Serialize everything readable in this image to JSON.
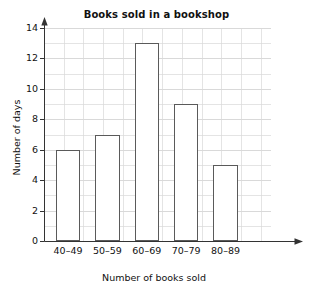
{
  "chart_data": {
    "type": "bar",
    "title": "Books sold in a bookshop",
    "xlabel": "Number of books sold",
    "ylabel": "Number of days",
    "categories": [
      "40–49",
      "50–59",
      "60–69",
      "70–79",
      "80–89"
    ],
    "values": [
      6,
      7,
      13,
      9,
      5
    ],
    "series": [
      {
        "name": "Number of days",
        "values": [
          6,
          7,
          13,
          9,
          5
        ]
      }
    ],
    "ylim": [
      0,
      14
    ],
    "y_tick_step": 2,
    "y_tick_labels": [
      "0",
      "2",
      "4",
      "6",
      "8",
      "10",
      "12",
      "14"
    ],
    "y_minor_step": 1,
    "xlim_categories": 5,
    "grid": true,
    "grid_color": "#d9d9d9",
    "legend": "none",
    "bar_fill": "#ffffff",
    "bar_stroke": "#5a5a5a",
    "axis_color": "#333333",
    "axis_arrows": true
  }
}
